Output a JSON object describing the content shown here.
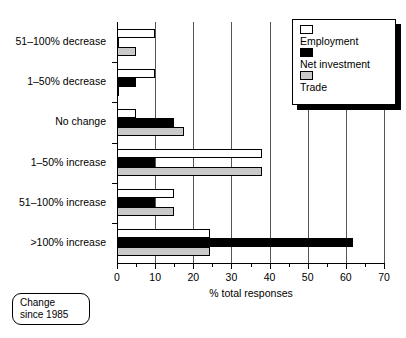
{
  "chart_data": {
    "type": "bar",
    "orientation": "horizontal",
    "title": "",
    "xlabel": "% total responses",
    "ylabel": "",
    "xlim": [
      0,
      70
    ],
    "xticks": [
      0,
      10,
      20,
      30,
      40,
      50,
      60,
      70
    ],
    "xtick_labels": [
      "0",
      "10",
      "20",
      "30",
      "40",
      "50",
      "60",
      "70"
    ],
    "minor_tick_step": 5,
    "grid": "vertical",
    "legend_position": "top-right",
    "categories": [
      "51–100% decrease",
      "1–50% decrease",
      "No change",
      "1–50% increase",
      "51–100% increase",
      ">100% increase"
    ],
    "series": [
      {
        "name": "Employment",
        "color": "#ffffff",
        "values": [
          10,
          10,
          5,
          38,
          15,
          24.5
        ]
      },
      {
        "name": "Net investment",
        "color": "#000000",
        "values": [
          0.5,
          5,
          15,
          10,
          10,
          62
        ]
      },
      {
        "name": "Trade",
        "color": "#c9c9c9",
        "values": [
          5,
          0.5,
          17.5,
          38,
          15,
          24.5
        ]
      }
    ]
  },
  "legend": {
    "items": [
      {
        "label": "Employment",
        "swatch": "employment"
      },
      {
        "label": "Net investment",
        "swatch": "netinv"
      },
      {
        "label": "Trade",
        "swatch": "trade"
      }
    ]
  },
  "note": {
    "line1": "Change",
    "line2": "since 1985"
  }
}
